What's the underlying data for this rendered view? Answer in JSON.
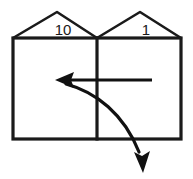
{
  "diagram": {
    "columns": [
      {
        "id": "tens",
        "label": "10"
      },
      {
        "id": "ones",
        "label": "1"
      }
    ],
    "arrows": [
      {
        "id": "straight-left-arrow",
        "direction": "left",
        "meaning": "regroup into tens column"
      },
      {
        "id": "curved-down-arrow",
        "direction": "down",
        "meaning": "carry out below ones column"
      }
    ],
    "colors": {
      "ink": "#1a1a1a",
      "arrow": "#111111",
      "background": "#ffffff"
    }
  }
}
